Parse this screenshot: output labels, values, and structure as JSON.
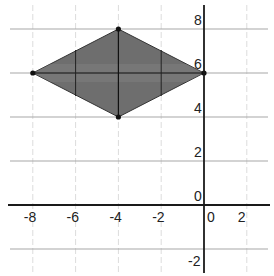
{
  "chart_data": {
    "type": "scatter",
    "title": "",
    "xlabel": "",
    "ylabel": "",
    "xlim": [
      -8.8,
      3.1
    ],
    "ylim": [
      -3.1,
      9.1
    ],
    "grid": true,
    "legend": null,
    "x_ticks": [
      -8,
      -6,
      -4,
      -2,
      0,
      2
    ],
    "y_ticks": [
      -2,
      0,
      2,
      4,
      6,
      8
    ],
    "x_tick_labels": [
      "-8",
      "-6",
      "-4",
      "-2",
      "0",
      "2"
    ],
    "y_tick_labels": [
      "-2",
      "0",
      "2",
      "4",
      "6",
      "8"
    ],
    "series": [
      {
        "name": "rhombus",
        "shape": "filled polygon",
        "fill": "#6e6e6e",
        "vertices": [
          [
            -8,
            6
          ],
          [
            -4,
            8
          ],
          [
            0,
            6
          ],
          [
            -4,
            4
          ]
        ],
        "diagonals": [
          [
            [
              -8,
              6
            ],
            [
              0,
              6
            ]
          ],
          [
            [
              -4,
              8
            ],
            [
              -4,
              4
            ]
          ]
        ]
      }
    ],
    "extra_lines": [
      {
        "from": [
          -6,
          5
        ],
        "to": [
          -6,
          7
        ],
        "note": "vertical segment inside shape at x=-6"
      },
      {
        "from": [
          -2,
          5
        ],
        "to": [
          -2,
          7
        ],
        "note": "vertical segment inside shape at x=-2"
      }
    ]
  },
  "colors": {
    "axis": "#1a1a1a",
    "grid_major": "#a8a8a8",
    "grid_minor": "#dcdcdc",
    "fill": "#6e6e6e",
    "vertex": "#111111"
  }
}
